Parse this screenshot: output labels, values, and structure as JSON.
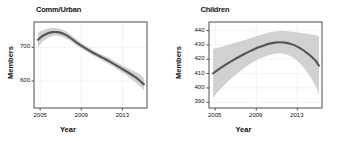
{
  "figure": {
    "panel_count": 2,
    "background_color": "#ffffff",
    "line_color": "#555555",
    "ribbon_color": "#c9c9c9",
    "grid_color": "#f0f0f0",
    "frame_color": "#4d4d4d"
  },
  "chart_data": [
    {
      "type": "line",
      "title": "Comm/Urban",
      "xlabel": "Year",
      "ylabel": "Members",
      "xlim": [
        2004.4,
        2015.4
      ],
      "ylim": [
        520,
        775
      ],
      "xticks": [
        2005,
        2009,
        2013
      ],
      "xtick_labels": [
        "2005",
        "2009",
        "2013"
      ],
      "yticks": [
        600,
        700
      ],
      "ytick_labels": [
        "600",
        "700"
      ],
      "grid": true,
      "legend": "none",
      "series": [
        {
          "name": "Comm/Urban members trend",
          "x": [
            2004.8,
            2005.2,
            2005.7,
            2006.2,
            2006.7,
            2007.2,
            2007.7,
            2008.2,
            2008.7,
            2009.2,
            2009.7,
            2010.2,
            2010.7,
            2011.2,
            2011.7,
            2012.2,
            2012.7,
            2013.2,
            2013.7,
            2014.2,
            2014.7,
            2015.1
          ],
          "values": [
            722,
            733,
            741,
            745,
            745,
            741,
            733,
            722,
            711,
            701,
            692,
            683,
            675,
            667,
            659,
            650,
            641,
            632,
            623,
            613,
            601,
            590
          ],
          "ci_lower": [
            700,
            716,
            727,
            733,
            734,
            730,
            723,
            713,
            702,
            693,
            684,
            675,
            667,
            658,
            650,
            641,
            631,
            621,
            610,
            598,
            585,
            572
          ],
          "ci_upper": [
            744,
            750,
            755,
            757,
            756,
            752,
            744,
            732,
            720,
            709,
            700,
            691,
            683,
            676,
            669,
            660,
            651,
            643,
            636,
            629,
            620,
            609
          ]
        }
      ]
    },
    {
      "type": "line",
      "title": "Children",
      "xlabel": "Year",
      "ylabel": "Members",
      "xlim": [
        2004.4,
        2015.4
      ],
      "ylim": [
        386,
        446
      ],
      "xticks": [
        2005,
        2009,
        2013
      ],
      "xtick_labels": [
        "2005",
        "2009",
        "2013"
      ],
      "yticks": [
        390,
        400,
        410,
        420,
        430,
        440
      ],
      "ytick_labels": [
        "390",
        "400",
        "410",
        "420",
        "430",
        "440"
      ],
      "grid": true,
      "legend": "none",
      "series": [
        {
          "name": "Children members trend",
          "x": [
            2004.8,
            2005.3,
            2005.8,
            2006.3,
            2006.8,
            2007.3,
            2007.8,
            2008.3,
            2008.8,
            2009.3,
            2009.8,
            2010.3,
            2010.8,
            2011.3,
            2011.8,
            2012.3,
            2012.8,
            2013.3,
            2013.8,
            2014.3,
            2014.8,
            2015.1
          ],
          "values": [
            410.2,
            412.8,
            415.2,
            417.5,
            419.6,
            421.6,
            423.5,
            425.3,
            427.0,
            428.5,
            429.8,
            430.9,
            431.6,
            431.9,
            431.6,
            430.8,
            429.5,
            427.6,
            425.2,
            422.3,
            418.8,
            415.5
          ],
          "ci_lower": [
            393.0,
            397.6,
            401.4,
            404.8,
            408.0,
            411.0,
            413.8,
            416.3,
            418.5,
            420.3,
            421.8,
            423.0,
            423.8,
            424.0,
            423.5,
            422.2,
            420.0,
            416.8,
            412.5,
            407.2,
            400.8,
            395.0
          ],
          "ci_upper": [
            427.4,
            428.0,
            429.0,
            430.2,
            431.2,
            432.2,
            433.2,
            434.3,
            435.5,
            436.7,
            437.8,
            438.8,
            439.4,
            439.8,
            439.7,
            439.4,
            439.0,
            438.4,
            437.9,
            437.4,
            436.8,
            436.0
          ]
        }
      ]
    }
  ]
}
